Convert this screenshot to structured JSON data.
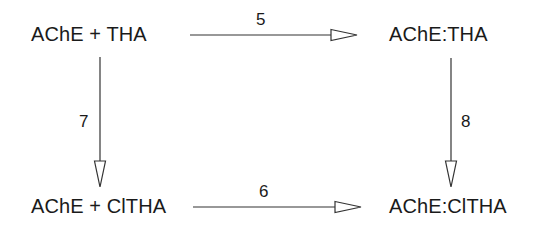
{
  "diagram": {
    "type": "reaction-scheme",
    "nodes": [
      {
        "id": "top_left",
        "label": "AChE + THA"
      },
      {
        "id": "top_right",
        "label": "AChE:THA"
      },
      {
        "id": "bottom_left",
        "label": "AChE + ClTHA"
      },
      {
        "id": "bottom_right",
        "label": "AChE:ClTHA"
      }
    ],
    "edges": [
      {
        "id": "top",
        "from": "top_left",
        "to": "top_right",
        "label": "5"
      },
      {
        "id": "bottom",
        "from": "bottom_left",
        "to": "bottom_right",
        "label": "6"
      },
      {
        "id": "left",
        "from": "top_left",
        "to": "bottom_left",
        "label": "7"
      },
      {
        "id": "right",
        "from": "top_right",
        "to": "bottom_right",
        "label": "8"
      }
    ],
    "colors": {
      "ink": "#1a1a1a",
      "line": "#333333",
      "background": "#ffffff"
    }
  }
}
